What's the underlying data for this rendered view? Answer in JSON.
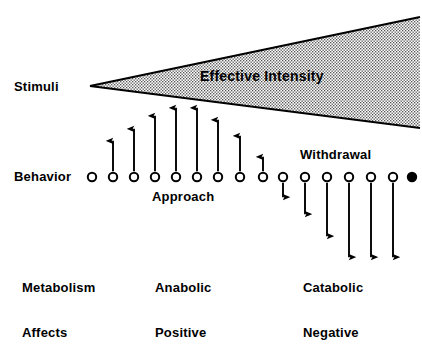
{
  "figure": {
    "title_region": "stimulus-intensity-behavior-diagram",
    "background_color": "#ffffff",
    "ink_color": "#000000",
    "wedge_fill_color": "#d8d8d8"
  },
  "labels": {
    "stimuli": "Stimuli",
    "effective_intensity": "Effective Intensity",
    "behavior": "Behavior",
    "approach": "Approach",
    "withdrawal": "Withdrawal",
    "metabolism_row_label": "Metabolism",
    "metabolism_left": "Anabolic",
    "metabolism_right": "Catabolic",
    "affects_row_label": "Affects",
    "affects_left": "Positive",
    "affects_right": "Negative"
  },
  "chart_data": {
    "type": "diagram",
    "title": "Effective Intensity",
    "xlabel": "",
    "ylabel": "",
    "grid": false,
    "legend": "none",
    "wedge": {
      "name": "effective-intensity-wedge",
      "apex": [
        90,
        86
      ],
      "top_right": [
        420,
        17
      ],
      "bottom_right": [
        420,
        128
      ],
      "fill": "stippled",
      "fill_color": "#d8d8d8",
      "outline_color": "#000000"
    },
    "baseline_y": 177,
    "circle_radius": 4.2,
    "points": [
      {
        "index": 0,
        "x": 92,
        "filled": false,
        "arrow_direction": "none",
        "arrow_length": 0
      },
      {
        "index": 1,
        "x": 113,
        "filled": false,
        "arrow_direction": "up",
        "arrow_length": 32
      },
      {
        "index": 2,
        "x": 134,
        "filled": false,
        "arrow_direction": "up",
        "arrow_length": 44
      },
      {
        "index": 3,
        "x": 155,
        "filled": false,
        "arrow_direction": "up",
        "arrow_length": 57
      },
      {
        "index": 4,
        "x": 176,
        "filled": false,
        "arrow_direction": "up",
        "arrow_length": 65
      },
      {
        "index": 5,
        "x": 197,
        "filled": false,
        "arrow_direction": "up",
        "arrow_length": 65
      },
      {
        "index": 6,
        "x": 218,
        "filled": false,
        "arrow_direction": "up",
        "arrow_length": 53
      },
      {
        "index": 7,
        "x": 240,
        "filled": false,
        "arrow_direction": "up",
        "arrow_length": 37
      },
      {
        "index": 8,
        "x": 263,
        "filled": false,
        "arrow_direction": "up",
        "arrow_length": 16
      },
      {
        "index": 9,
        "x": 283,
        "filled": false,
        "arrow_direction": "down",
        "arrow_length": 16
      },
      {
        "index": 10,
        "x": 305,
        "filled": false,
        "arrow_direction": "down",
        "arrow_length": 33
      },
      {
        "index": 11,
        "x": 327,
        "filled": false,
        "arrow_direction": "down",
        "arrow_length": 55
      },
      {
        "index": 12,
        "x": 349,
        "filled": false,
        "arrow_direction": "down",
        "arrow_length": 76
      },
      {
        "index": 13,
        "x": 371,
        "filled": false,
        "arrow_direction": "down",
        "arrow_length": 76
      },
      {
        "index": 14,
        "x": 393,
        "filled": false,
        "arrow_direction": "down",
        "arrow_length": 76
      },
      {
        "index": 15,
        "x": 412,
        "filled": true,
        "arrow_direction": "none",
        "arrow_length": 0
      }
    ],
    "annotations": [
      {
        "text": "Stimuli",
        "x": 14,
        "y": 87
      },
      {
        "text": "Effective Intensity",
        "x": 200,
        "y": 77
      },
      {
        "text": "Behavior",
        "x": 14,
        "y": 177
      },
      {
        "text": "Approach",
        "x": 152,
        "y": 197
      },
      {
        "text": "Withdrawal",
        "x": 300,
        "y": 155
      }
    ],
    "bottom_rows": [
      {
        "row_label": "Metabolism",
        "left": "Anabolic",
        "right": "Catabolic"
      },
      {
        "row_label": "Affects",
        "left": "Positive",
        "right": "Negative"
      }
    ]
  }
}
